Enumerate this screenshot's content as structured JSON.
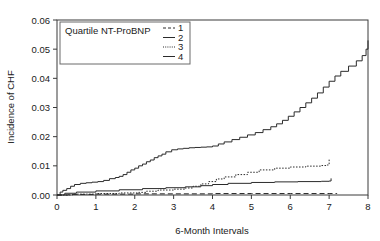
{
  "chart_data": {
    "type": "line",
    "title": "",
    "xlabel": "6-Month Intervals",
    "ylabel": "Incidence of CHF",
    "xlim": [
      0,
      8
    ],
    "ylim": [
      0,
      0.06
    ],
    "xticks": [
      "0",
      "1",
      "2",
      "3",
      "4",
      "5",
      "6",
      "7",
      "8"
    ],
    "xtick_values": [
      0,
      1,
      2,
      3,
      4,
      5,
      6,
      7,
      8
    ],
    "yticks": [
      "0.00",
      "0.01",
      "0.02",
      "0.03",
      "0.04",
      "0.05",
      "0.06"
    ],
    "ytick_values": [
      0,
      0.01,
      0.02,
      0.03,
      0.04,
      0.05,
      0.06
    ],
    "grid": false,
    "step_type": "post",
    "legend": {
      "title": "Quartile NT-ProBNP",
      "position": "upper-left",
      "entries": [
        {
          "label": "1",
          "style": "dashed"
        },
        {
          "label": "2",
          "style": "solid"
        },
        {
          "label": "3",
          "style": "dotted"
        },
        {
          "label": "4",
          "style": "solid"
        }
      ]
    },
    "series": [
      {
        "name": "1",
        "style": "dashed",
        "x": [
          0,
          0.3,
          1.0,
          2.0,
          3.0,
          4.0,
          5.0,
          6.0,
          7.0,
          7.2
        ],
        "y": [
          0.0,
          0.0002,
          0.0003,
          0.0004,
          0.0004,
          0.0005,
          0.0005,
          0.0005,
          0.0005,
          0.0006
        ]
      },
      {
        "name": "2",
        "style": "solid-dashed",
        "x": [
          0,
          0.2,
          0.5,
          1.0,
          1.6,
          2.2,
          2.8,
          3.3,
          3.7,
          4.0,
          4.4,
          5.0,
          5.6,
          6.2,
          6.8,
          7.0,
          7.05
        ],
        "y": [
          0.0,
          0.0006,
          0.001,
          0.0014,
          0.0018,
          0.0022,
          0.0025,
          0.0028,
          0.0032,
          0.0036,
          0.004,
          0.0043,
          0.0045,
          0.0046,
          0.0047,
          0.0048,
          0.0057
        ]
      },
      {
        "name": "3",
        "style": "dotted",
        "x": [
          0,
          0.4,
          1.0,
          1.6,
          2.1,
          2.3,
          2.6,
          3.0,
          3.3,
          3.5,
          3.7,
          3.9,
          4.1,
          4.3,
          4.6,
          4.9,
          5.2,
          5.6,
          6.0,
          6.4,
          6.8,
          6.95,
          7.0
        ],
        "y": [
          0.0,
          0.0003,
          0.0005,
          0.0007,
          0.0009,
          0.0013,
          0.0017,
          0.002,
          0.0024,
          0.003,
          0.0038,
          0.0046,
          0.0055,
          0.0062,
          0.007,
          0.0078,
          0.0086,
          0.0092,
          0.0096,
          0.0099,
          0.0101,
          0.0103,
          0.0122
        ]
      },
      {
        "name": "4",
        "style": "solid",
        "x": [
          0,
          0.08,
          0.15,
          0.25,
          0.35,
          0.45,
          0.6,
          0.75,
          0.9,
          1.05,
          1.2,
          1.35,
          1.5,
          1.6,
          1.7,
          1.8,
          1.9,
          2.0,
          2.1,
          2.2,
          2.3,
          2.4,
          2.5,
          2.6,
          2.7,
          2.8,
          2.95,
          3.1,
          3.25,
          3.4,
          3.55,
          3.7,
          3.85,
          4.0,
          4.15,
          4.3,
          4.5,
          4.7,
          4.9,
          5.1,
          5.3,
          5.5,
          5.65,
          5.8,
          5.95,
          6.1,
          6.25,
          6.4,
          6.55,
          6.7,
          6.85,
          7.0,
          7.15,
          7.3,
          7.5,
          7.7,
          7.85,
          7.95,
          8.0
        ],
        "y": [
          0.0,
          0.001,
          0.0016,
          0.0022,
          0.003,
          0.0036,
          0.004,
          0.0042,
          0.0044,
          0.0046,
          0.005,
          0.0056,
          0.006,
          0.0064,
          0.007,
          0.0078,
          0.0086,
          0.0092,
          0.01,
          0.0106,
          0.0114,
          0.012,
          0.0128,
          0.0134,
          0.014,
          0.0148,
          0.0155,
          0.0158,
          0.016,
          0.0162,
          0.0163,
          0.0164,
          0.0165,
          0.0168,
          0.0175,
          0.0182,
          0.019,
          0.0198,
          0.0206,
          0.0214,
          0.0224,
          0.0234,
          0.0244,
          0.0256,
          0.027,
          0.0285,
          0.03,
          0.0316,
          0.0332,
          0.035,
          0.037,
          0.039,
          0.0408,
          0.0424,
          0.0442,
          0.046,
          0.0478,
          0.05,
          0.053
        ]
      }
    ]
  }
}
